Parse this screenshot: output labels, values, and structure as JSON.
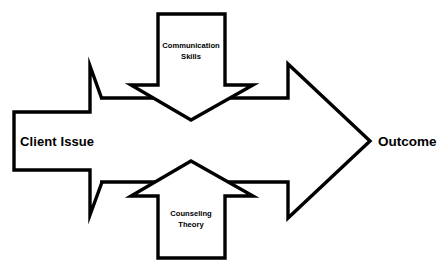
{
  "diagram": {
    "background_color": "#ffffff",
    "line_color": "#000000",
    "fill_color": "#ffffff",
    "nodes": {
      "input_arrow": {
        "label": "Client Issue",
        "shape": "right-arrow",
        "direction": "right"
      },
      "top_arrow": {
        "label_line1": "Communication",
        "label_line2": "Skills",
        "shape": "down-arrow",
        "direction": "down"
      },
      "bottom_arrow": {
        "label_line1": "Counseling",
        "label_line2": "Theory",
        "shape": "up-arrow",
        "direction": "up"
      },
      "output_arrow": {
        "label": "Outcome",
        "shape": "right-arrow",
        "direction": "right"
      }
    }
  }
}
